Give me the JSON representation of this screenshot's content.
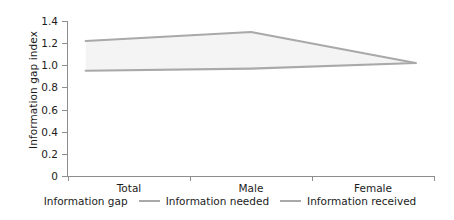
{
  "chart_data": {
    "type": "line",
    "title": "",
    "subtitle": "",
    "xlabel": "",
    "ylabel": "Information gap index",
    "categories": [
      "Total",
      "Male",
      "Female"
    ],
    "x": [
      0,
      1,
      2
    ],
    "ylim": [
      0,
      1.4
    ],
    "yticks": [
      "0",
      "0.2",
      "0.4",
      "0.6",
      "0.8",
      "1.0",
      "1.2",
      "1.4"
    ],
    "ytick_values": [
      0,
      0.2,
      0.4,
      0.6,
      0.8,
      1.0,
      1.2,
      1.4
    ],
    "grid": false,
    "legend_position": "bottom",
    "series": [
      {
        "name": "Information needed",
        "values": [
          1.22,
          1.3,
          1.02
        ],
        "color": "#a9a9a9"
      },
      {
        "name": "Information received",
        "values": [
          0.95,
          0.97,
          1.02
        ],
        "color": "#a9a9a9"
      }
    ],
    "band": {
      "name": "Information gap",
      "fill_color": "#f4f4f4",
      "upper": [
        1.22,
        1.3,
        1.02
      ],
      "lower": [
        0.95,
        0.97,
        1.02
      ]
    },
    "annotations": []
  },
  "legend": {
    "items": [
      {
        "label": "Information gap",
        "marker": "area-swatch",
        "color": "#f4f4f4"
      },
      {
        "label": "Information needed",
        "marker": "line-swatch",
        "color": "#a9a9a9"
      },
      {
        "label": "Information received",
        "marker": "line-swatch",
        "color": "#a9a9a9"
      }
    ]
  },
  "axes": {
    "y_title": "Information gap index"
  }
}
